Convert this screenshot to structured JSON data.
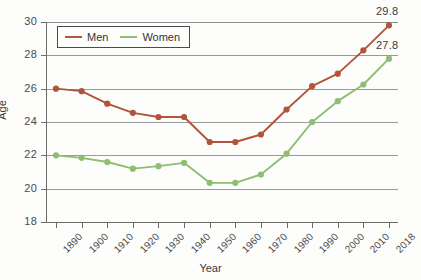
{
  "chart_data": {
    "type": "line",
    "title": "",
    "xlabel": "Year",
    "ylabel": "Age",
    "x": [
      1890,
      1900,
      1910,
      1920,
      1930,
      1940,
      1950,
      1960,
      1970,
      1980,
      1990,
      2000,
      2010,
      2018
    ],
    "categories": [
      "1890",
      "1900",
      "1910",
      "1920",
      "1930",
      "1940",
      "1950",
      "1960",
      "1970",
      "1980",
      "1990",
      "2000",
      "2010",
      "2018"
    ],
    "series": [
      {
        "name": "Men",
        "color": "#b0553a",
        "values": [
          26.0,
          25.85,
          25.1,
          24.55,
          24.3,
          24.3,
          22.8,
          22.8,
          23.25,
          24.75,
          26.15,
          26.9,
          28.3,
          29.8
        ]
      },
      {
        "name": "Women",
        "color": "#8fbd72",
        "values": [
          22.0,
          21.85,
          21.6,
          21.2,
          21.35,
          21.55,
          20.35,
          20.35,
          20.85,
          22.1,
          24.0,
          25.25,
          26.25,
          27.8
        ]
      }
    ],
    "ylim": [
      18,
      30
    ],
    "yticks": [
      18,
      20,
      22,
      24,
      26,
      28,
      30
    ],
    "ytick_labels": [
      "18",
      "20",
      "22",
      "24",
      "26",
      "28",
      "30"
    ],
    "grid": true,
    "grid_axis": "y",
    "legend_position": "top-left",
    "annotations": [
      {
        "label": "29.8",
        "series": "Men",
        "x": 2018,
        "y": 29.8
      },
      {
        "label": "27.8",
        "series": "Women",
        "x": 2018,
        "y": 27.8
      }
    ]
  },
  "legend": {
    "entries": [
      {
        "label": "Men",
        "color": "#b0553a"
      },
      {
        "label": "Women",
        "color": "#8fbd72"
      }
    ]
  },
  "axes": {
    "y_title": "Age",
    "x_title": "Year"
  }
}
